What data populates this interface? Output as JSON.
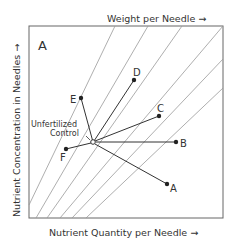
{
  "diagram": {
    "panel_label": "A",
    "top_axis_label": "Weight per Needle →",
    "x_axis_label": "Nutrient Quantity per Needle →",
    "y_axis_label": "Nutrient Concentration in Needles →",
    "control_label_line1": "Unfertilized",
    "control_label_line2": "Control",
    "points": {
      "A": "A",
      "B": "B",
      "C": "C",
      "D": "D",
      "E": "E",
      "F": "F"
    },
    "colors": {
      "frame": "#666666",
      "isolines": "#888888",
      "vectors": "#333333"
    }
  }
}
